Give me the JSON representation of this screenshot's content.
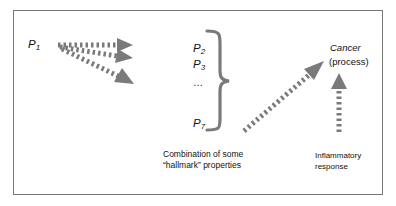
{
  "diagram": {
    "source_node": {
      "letter": "P",
      "sub": "1"
    },
    "property_nodes": [
      {
        "letter": "P",
        "sub": "2"
      },
      {
        "letter": "P",
        "sub": "3"
      },
      {
        "ellipsis": "…"
      },
      {
        "letter": "P",
        "sub": "7"
      }
    ],
    "target_node": {
      "title": "Cancer",
      "subtitle": "(process)"
    },
    "captions": {
      "hallmark": {
        "line1": "Combination of some",
        "line2": "“hallmark” properties"
      },
      "inflammatory": {
        "line1": "Inflammatory",
        "line2": "response"
      }
    },
    "colors": {
      "arrow": "#7a7a7a",
      "frame": "#777777",
      "text": "#111111"
    }
  }
}
